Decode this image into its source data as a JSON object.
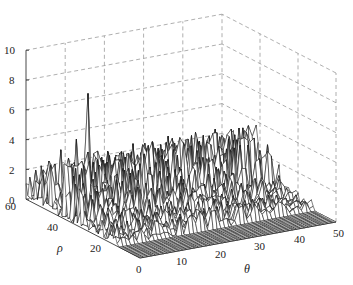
{
  "chart_data": {
    "type": "surface3d",
    "title": "",
    "xlabel": "θ",
    "ylabel": "ρ",
    "zlabel": "",
    "x_range": [
      0,
      50
    ],
    "y_range": [
      0,
      60
    ],
    "z_range": [
      0,
      10
    ],
    "x_ticks": [
      "0",
      "10",
      "20",
      "30",
      "40",
      "50"
    ],
    "y_ticks": [
      "20",
      "40",
      "60"
    ],
    "z_ticks": [
      "0",
      "2",
      "4",
      "6",
      "8",
      "10"
    ],
    "grid": true,
    "grid_style": "dashed",
    "surface_style": "wireframe mesh, white faces, black edges",
    "flat_region": "rho < ~12 is zero (dense flat mesh on floor)",
    "peaks": [
      {
        "theta": 10,
        "rho": 48,
        "z": 7.4,
        "note": "global maximum, sharp spike"
      },
      {
        "theta": 8,
        "rho": 50,
        "z": 4.3
      },
      {
        "theta": 5,
        "rho": 52,
        "z": 3.6
      },
      {
        "theta": 38,
        "rho": 40,
        "z": 3.9
      },
      {
        "theta": 35,
        "rho": 42,
        "z": 3.5
      },
      {
        "theta": 45,
        "rho": 38,
        "z": 3.4
      },
      {
        "theta": 2,
        "rho": 55,
        "z": 2.2
      },
      {
        "theta": 22,
        "rho": 45,
        "z": 2.8
      }
    ],
    "background_level": "random noise roughly 0.5-2.5 for rho in [12,60]"
  },
  "axes": {
    "z_tick_labels": [
      "0",
      "2",
      "4",
      "6",
      "8",
      "10"
    ],
    "theta_tick_labels": [
      "0",
      "10",
      "20",
      "30",
      "40",
      "50"
    ],
    "rho_tick_labels": [
      "20",
      "40",
      "60"
    ],
    "theta_label": "θ",
    "rho_label": "ρ"
  }
}
